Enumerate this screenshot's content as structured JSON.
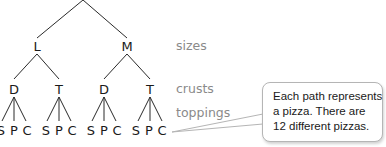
{
  "tree": {
    "root": "",
    "sizes": [
      {
        "label": "L",
        "crusts": [
          {
            "label": "D",
            "toppings": [
              "S",
              "P",
              "C"
            ]
          },
          {
            "label": "T",
            "toppings": [
              "S",
              "P",
              "C"
            ]
          }
        ]
      },
      {
        "label": "M",
        "crusts": [
          {
            "label": "D",
            "toppings": [
              "S",
              "P",
              "C"
            ]
          },
          {
            "label": "T",
            "toppings": [
              "S",
              "P",
              "C"
            ]
          }
        ]
      }
    ]
  },
  "level_labels": {
    "sizes": "sizes",
    "crusts": "crusts",
    "toppings": "toppings"
  },
  "callout": {
    "lines": [
      "Each path represents",
      "a pizza. There are",
      "12 different pizzas."
    ]
  },
  "colors": {
    "line": "#2a2a2a",
    "level_label": "#8a8a8a",
    "callout_border": "#b5b5b5"
  }
}
